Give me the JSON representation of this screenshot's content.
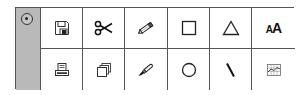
{
  "palette": {
    "handle": {
      "icon": "radio-button-selected-icon"
    },
    "tools": [
      {
        "row": 1,
        "col": 1,
        "icon": "floppy-disk-save-icon",
        "label": "Save"
      },
      {
        "row": 1,
        "col": 2,
        "icon": "scissors-cut-icon",
        "label": "Cut"
      },
      {
        "row": 1,
        "col": 3,
        "icon": "pencil-icon",
        "label": "Pencil"
      },
      {
        "row": 1,
        "col": 4,
        "icon": "rectangle-icon",
        "label": "Rectangle"
      },
      {
        "row": 1,
        "col": 5,
        "icon": "triangle-icon",
        "label": "Triangle"
      },
      {
        "row": 1,
        "col": 6,
        "icon": "font-size-icon",
        "label": "Text",
        "text_small": "A",
        "text_big": "A"
      },
      {
        "row": 2,
        "col": 1,
        "icon": "printer-icon",
        "label": "Print"
      },
      {
        "row": 2,
        "col": 2,
        "icon": "copy-stack-icon",
        "label": "Copy"
      },
      {
        "row": 2,
        "col": 3,
        "icon": "paintbrush-icon",
        "label": "Brush"
      },
      {
        "row": 2,
        "col": 4,
        "icon": "circle-icon",
        "label": "Circle"
      },
      {
        "row": 2,
        "col": 5,
        "icon": "line-icon",
        "label": "Line"
      },
      {
        "row": 2,
        "col": 6,
        "icon": "chart-grid-icon",
        "label": "Chart"
      }
    ]
  },
  "colors": {
    "handle_bg": "#b9b9b9",
    "border": "#555555",
    "icon": "#222222"
  }
}
